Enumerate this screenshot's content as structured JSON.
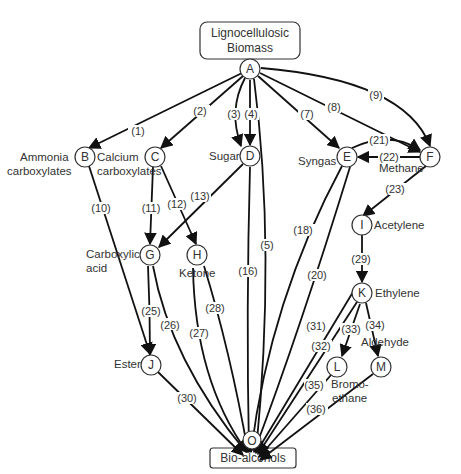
{
  "diagram": {
    "source_box": {
      "line1": "Lignocellulosic",
      "line2": "Biomass"
    },
    "target_box": {
      "text": "Bio-alcohols"
    },
    "nodes": {
      "A": {
        "letter": "A"
      },
      "B": {
        "letter": "B",
        "label1": "Ammonia",
        "label2": "carboxylates"
      },
      "C": {
        "letter": "C",
        "label1": "Calcium",
        "label2": "carboxylates"
      },
      "D": {
        "letter": "D",
        "label1": "Sugar"
      },
      "E": {
        "letter": "E",
        "label1": "Syngas"
      },
      "F": {
        "letter": "F",
        "label1": "Methane"
      },
      "G": {
        "letter": "G",
        "label1": "Carboxylic",
        "label2": "acid"
      },
      "H": {
        "letter": "H",
        "label1": "Ketone"
      },
      "I": {
        "letter": "I",
        "label1": "Acetylene"
      },
      "J": {
        "letter": "J",
        "label1": "Ester"
      },
      "K": {
        "letter": "K",
        "label1": "Ethylene"
      },
      "L": {
        "letter": "L",
        "label1": "Bromo-",
        "label2": "ethane"
      },
      "M": {
        "letter": "M",
        "label1": "Aldehyde"
      },
      "O": {
        "letter": "O"
      }
    },
    "edges": {
      "e1": "(1)",
      "e2": "(2)",
      "e3": "(3)",
      "e4": "(4)",
      "e5": "(5)",
      "e7": "(7)",
      "e8": "(8)",
      "e9": "(9)",
      "e10": "(10)",
      "e11": "(11)",
      "e12": "(12)",
      "e13": "(13)",
      "e16": "(16)",
      "e18": "(18)",
      "e20": "(20)",
      "e21": "(21)",
      "e22": "(22)",
      "e23": "(23)",
      "e25": "(25)",
      "e26": "(26)",
      "e27": "(27)",
      "e28": "(28)",
      "e29": "(29)",
      "e30": "(30)",
      "e31": "(31)",
      "e32": "(32)",
      "e33": "(33)",
      "e34": "(34)",
      "e35": "(35)",
      "e36": "(36)"
    },
    "edge_list": [
      {
        "id": "1",
        "from": "A",
        "to": "B"
      },
      {
        "id": "2",
        "from": "A",
        "to": "C"
      },
      {
        "id": "3",
        "from": "A",
        "to": "D"
      },
      {
        "id": "4",
        "from": "A",
        "to": "D"
      },
      {
        "id": "5",
        "from": "A",
        "to": "O"
      },
      {
        "id": "7",
        "from": "A",
        "to": "E"
      },
      {
        "id": "8",
        "from": "A",
        "to": "F"
      },
      {
        "id": "9",
        "from": "A",
        "to": "F"
      },
      {
        "id": "10",
        "from": "B",
        "to": "J"
      },
      {
        "id": "11",
        "from": "C",
        "to": "G"
      },
      {
        "id": "12",
        "from": "C",
        "to": "H"
      },
      {
        "id": "13",
        "from": "D",
        "to": "G"
      },
      {
        "id": "16",
        "from": "D",
        "to": "O"
      },
      {
        "id": "18",
        "from": "E",
        "to": "O"
      },
      {
        "id": "20",
        "from": "E",
        "to": "O"
      },
      {
        "id": "21",
        "from": "E",
        "to": "F"
      },
      {
        "id": "22",
        "from": "F",
        "to": "E"
      },
      {
        "id": "23",
        "from": "F",
        "to": "I"
      },
      {
        "id": "25",
        "from": "G",
        "to": "J"
      },
      {
        "id": "26",
        "from": "G",
        "to": "O"
      },
      {
        "id": "27",
        "from": "H",
        "to": "O"
      },
      {
        "id": "28",
        "from": "H",
        "to": "O"
      },
      {
        "id": "29",
        "from": "I",
        "to": "K"
      },
      {
        "id": "30",
        "from": "J",
        "to": "O"
      },
      {
        "id": "31",
        "from": "K",
        "to": "O"
      },
      {
        "id": "32",
        "from": "K",
        "to": "O"
      },
      {
        "id": "33",
        "from": "K",
        "to": "L"
      },
      {
        "id": "34",
        "from": "K",
        "to": "M"
      },
      {
        "id": "35",
        "from": "L",
        "to": "O"
      },
      {
        "id": "36",
        "from": "M",
        "to": "O"
      }
    ]
  }
}
